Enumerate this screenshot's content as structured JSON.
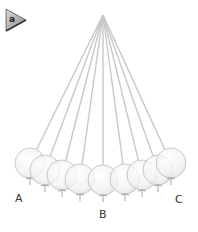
{
  "panel_label": "a",
  "points": [
    {
      "id": "A",
      "label": "A",
      "x": 15,
      "y": 193
    },
    {
      "id": "B",
      "label": "B",
      "x": 99,
      "y": 209
    },
    {
      "id": "C",
      "label": "C",
      "x": 175,
      "y": 194
    }
  ],
  "pivot": {
    "x": 103,
    "y": 15
  },
  "balls": [
    {
      "cx": 30,
      "cy": 163,
      "r": 15
    },
    {
      "cx": 45,
      "cy": 170,
      "r": 15
    },
    {
      "cx": 62,
      "cy": 175,
      "r": 15
    },
    {
      "cx": 80,
      "cy": 179,
      "r": 15
    },
    {
      "cx": 103,
      "cy": 180,
      "r": 15
    },
    {
      "cx": 125,
      "cy": 179,
      "r": 15
    },
    {
      "cx": 142,
      "cy": 175,
      "r": 15
    },
    {
      "cx": 158,
      "cy": 170,
      "r": 15
    },
    {
      "cx": 171,
      "cy": 163,
      "r": 15
    }
  ],
  "colors": {
    "string": "#c8c8c8",
    "ball_fill": "#f4f4f4",
    "ball_stroke": "#bdbdbd",
    "tag_fill": "#b0b0b0",
    "tag_stroke": "#555555",
    "label": "#333333"
  }
}
